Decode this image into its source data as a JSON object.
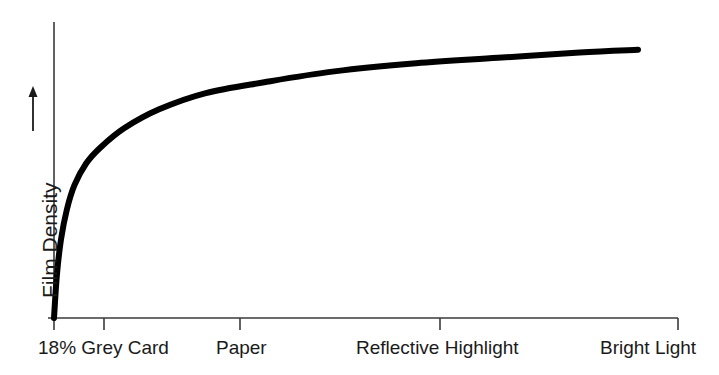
{
  "chart_data": {
    "type": "line",
    "title": "",
    "subtitle": "",
    "xlabel": "",
    "ylabel": "Film Density",
    "ylabel_arrow": "upward-arrow",
    "grid": false,
    "legend": "none",
    "categories": [
      "18% Grey Card",
      "Paper",
      "Reflective Highlight",
      "Bright Light"
    ],
    "tick_positions_px": [
      54,
      104,
      240,
      440,
      678
    ],
    "xlim": [
      0,
      10
    ],
    "ylim": [
      0,
      10
    ],
    "annotations": [],
    "series": [
      {
        "name": "Film characteristic curve",
        "description": "Logarithmic film density response rising steeply from the shadow point then flattening toward bright light",
        "x": [
          0.0,
          0.05,
          0.12,
          0.22,
          0.35,
          0.55,
          0.8,
          1.2,
          1.8,
          2.6,
          3.6,
          4.8,
          6.2,
          7.6,
          9.0,
          10.0
        ],
        "y": [
          0.0,
          1.6,
          2.9,
          4.0,
          4.9,
          5.7,
          6.3,
          7.0,
          7.7,
          8.3,
          8.7,
          9.1,
          9.4,
          9.6,
          9.8,
          9.9
        ]
      }
    ]
  },
  "axis": {
    "y_axis_label": "Film Density",
    "x_tick_labels": [
      {
        "label": "18% Grey Card",
        "left_px": 38
      },
      {
        "label": "Paper",
        "left_px": 216
      },
      {
        "label": "Reflective Highlight",
        "left_px": 356
      },
      {
        "label": "Bright Light",
        "left_px": 600
      }
    ]
  },
  "colors": {
    "curve": "#000000",
    "axis": "#3a3a3a",
    "text": "#1a1a1a",
    "background": "#ffffff"
  }
}
